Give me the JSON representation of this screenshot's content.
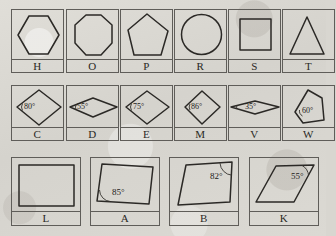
{
  "worksheet": {
    "title": "Shape cards with labeled angles",
    "background_color": "#d9d7d1",
    "ink_color": "#2b2926",
    "degree_symbol": "°"
  },
  "rows": [
    {
      "row_name": "polygons-row",
      "cards": [
        {
          "label": "H",
          "shape": "hexagon",
          "angle": null
        },
        {
          "label": "O",
          "shape": "octagon",
          "angle": null
        },
        {
          "label": "P",
          "shape": "pentagon",
          "angle": null
        },
        {
          "label": "R",
          "shape": "circle",
          "angle": null
        },
        {
          "label": "S",
          "shape": "square",
          "angle": null
        },
        {
          "label": "T",
          "shape": "triangle",
          "angle": null
        }
      ]
    },
    {
      "row_name": "rhombus-row",
      "cards": [
        {
          "label": "C",
          "shape": "rhombus",
          "angle": "80°"
        },
        {
          "label": "D",
          "shape": "flat-rhombus",
          "angle": "55°"
        },
        {
          "label": "E",
          "shape": "rhombus",
          "angle": "75°"
        },
        {
          "label": "M",
          "shape": "rhombus",
          "angle": "86°"
        },
        {
          "label": "V",
          "shape": "very-flat-rhombus",
          "angle": "35°"
        },
        {
          "label": "W",
          "shape": "irregular-pentagon",
          "angle": "60°"
        }
      ]
    },
    {
      "row_name": "quadrilateral-row",
      "cards": [
        {
          "label": "L",
          "shape": "rectangle",
          "angle": null
        },
        {
          "label": "A",
          "shape": "parallelogram-right",
          "angle": "85°"
        },
        {
          "label": "B",
          "shape": "parallelogram-left",
          "angle": "82°"
        },
        {
          "label": "K",
          "shape": "slanted-parallelogram",
          "angle": "55°"
        }
      ]
    }
  ]
}
